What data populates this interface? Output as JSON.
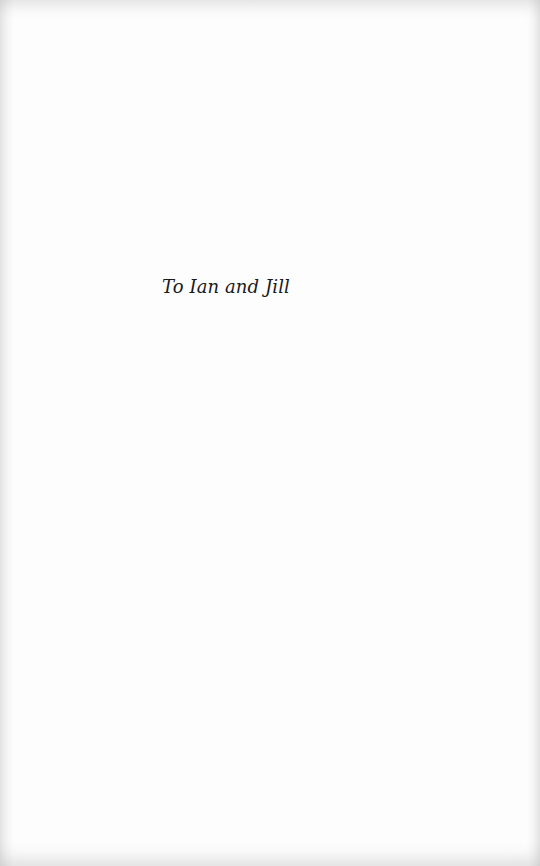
{
  "page": {
    "dedication": "To Ian and Jill"
  }
}
